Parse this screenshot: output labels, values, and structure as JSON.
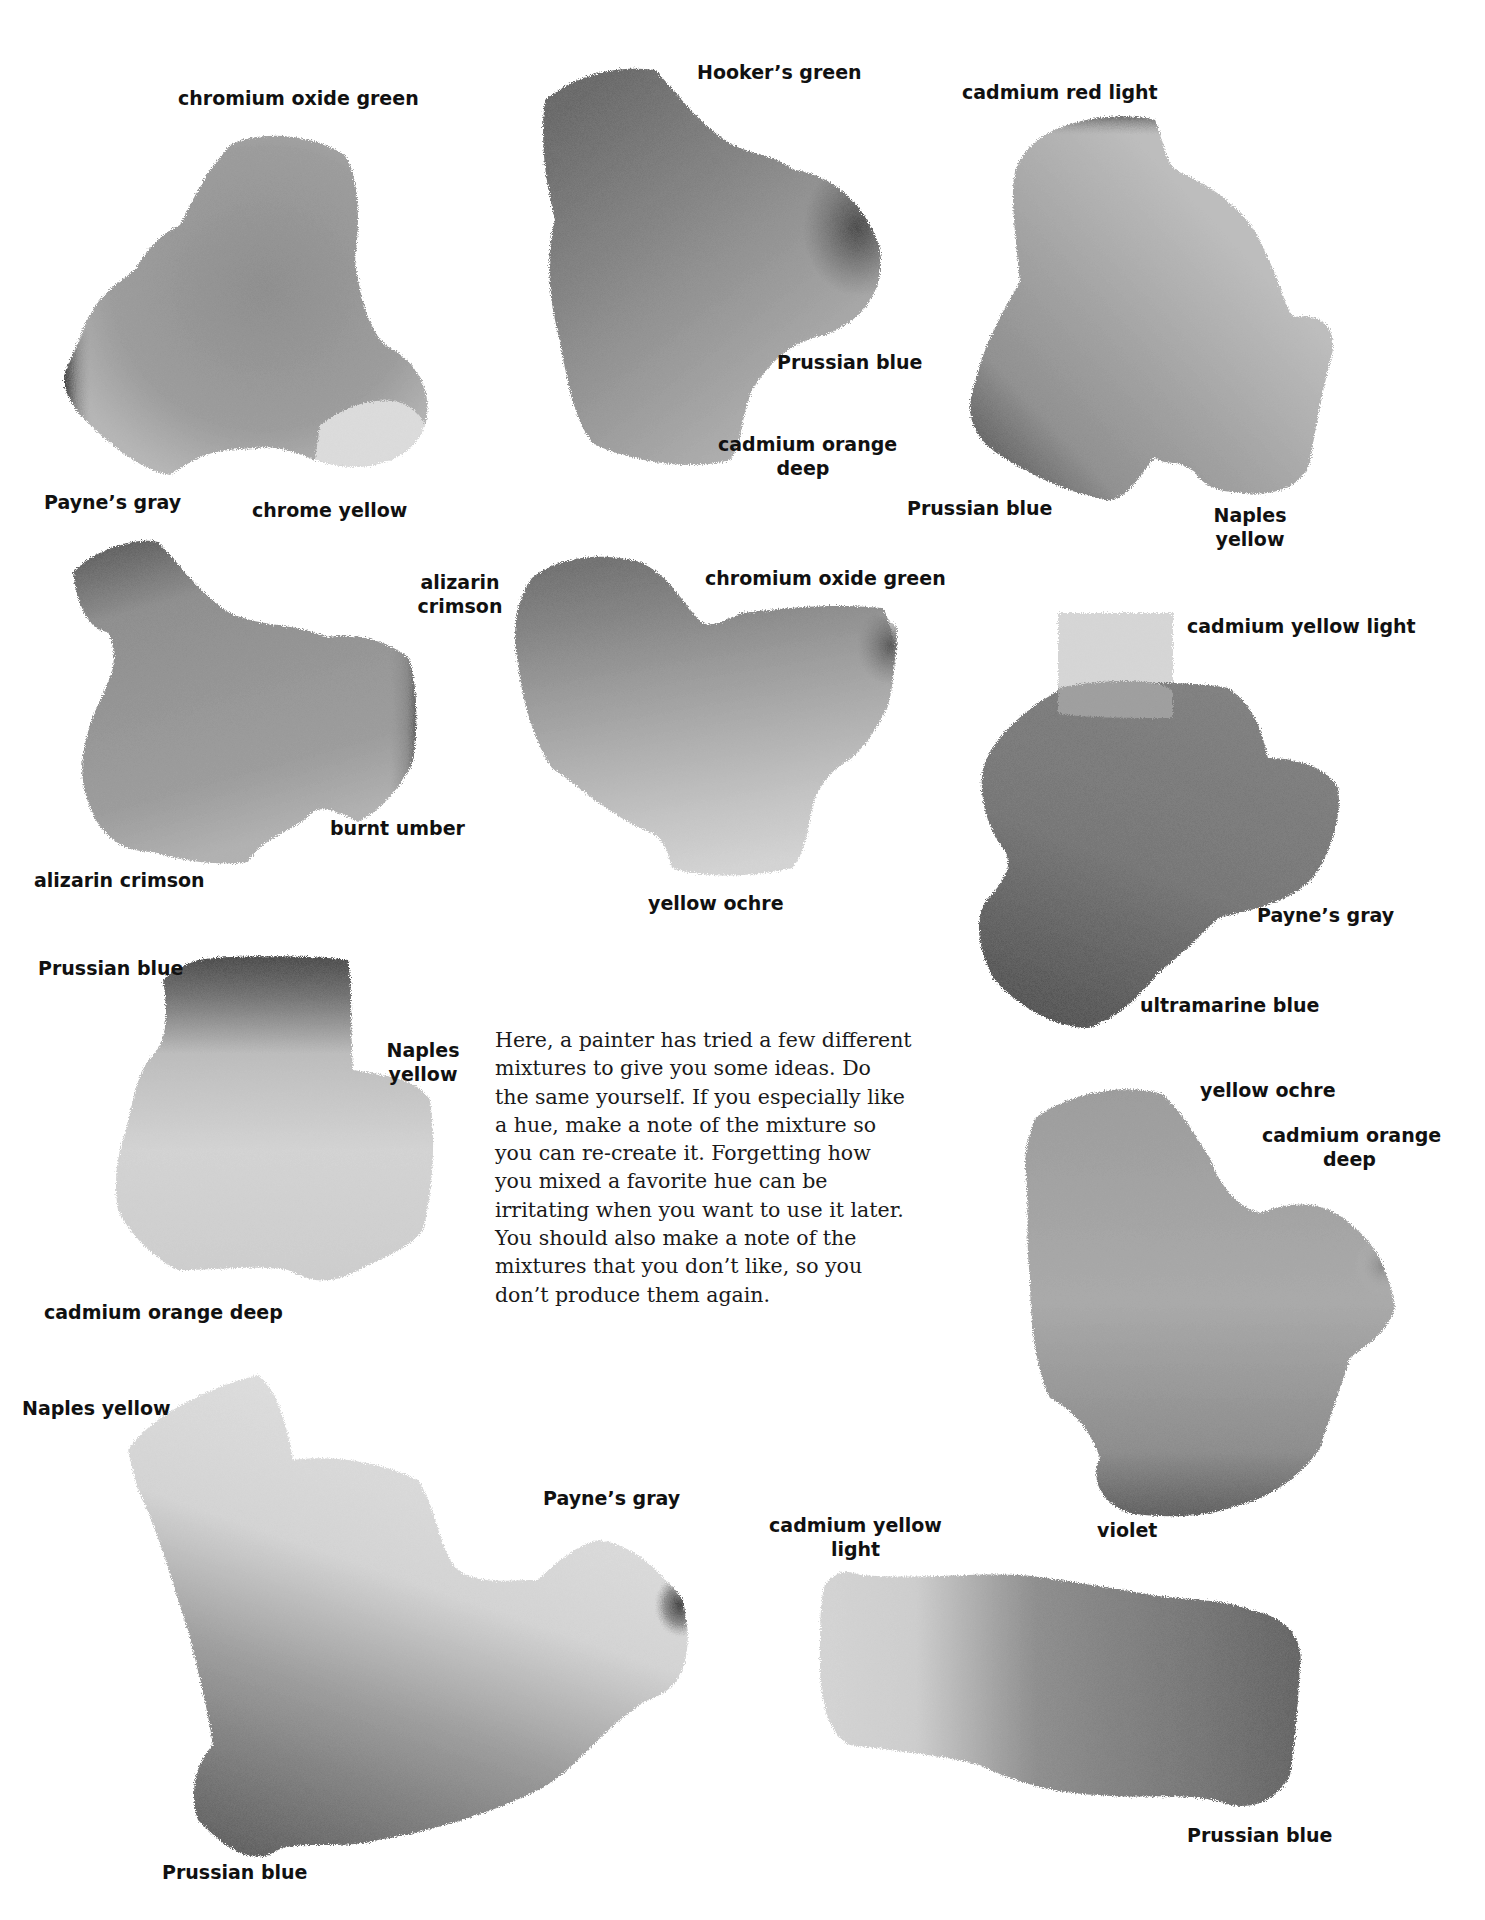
{
  "page": {
    "type": "watercolor color-mixing swatch page",
    "paper_color": "#ffffff"
  },
  "swatches": [
    {
      "id": "mix-1",
      "colors": [
        "chromium oxide green",
        "Payne's gray",
        "chrome yellow"
      ],
      "labels": [
        "chromium oxide green",
        "Payne’s gray",
        "chrome yellow"
      ]
    },
    {
      "id": "mix-2",
      "colors": [
        "Hooker's green",
        "Prussian blue",
        "cadmium orange deep"
      ],
      "labels": [
        "Hooker’s green",
        "Prussian blue",
        "cadmium orange",
        "deep"
      ]
    },
    {
      "id": "mix-3",
      "colors": [
        "cadmium red light",
        "Prussian blue",
        "Naples yellow"
      ],
      "labels": [
        "cadmium red light",
        "Prussian blue",
        "Naples",
        "yellow"
      ]
    },
    {
      "id": "mix-4",
      "colors": [
        "alizarin crimson",
        "burnt umber",
        "alizarin crimson"
      ],
      "labels": [
        "alizarin",
        "crimson",
        "burnt umber",
        "alizarin crimson"
      ]
    },
    {
      "id": "mix-5",
      "colors": [
        "chromium oxide green",
        "yellow ochre"
      ],
      "labels": [
        "chromium oxide green",
        "yellow ochre"
      ]
    },
    {
      "id": "mix-6",
      "colors": [
        "cadmium yellow light",
        "Payne's gray",
        "ultramarine blue"
      ],
      "labels": [
        "cadmium yellow light",
        "Payne’s gray",
        "ultramarine blue"
      ]
    },
    {
      "id": "mix-7",
      "colors": [
        "Prussian blue",
        "Naples yellow",
        "cadmium orange deep"
      ],
      "labels": [
        "Prussian blue",
        "Naples",
        "yellow",
        "cadmium orange deep"
      ]
    },
    {
      "id": "mix-8",
      "colors": [
        "yellow ochre",
        "cadmium orange deep",
        "violet"
      ],
      "labels": [
        "yellow ochre",
        "cadmium orange",
        "deep",
        "violet"
      ]
    },
    {
      "id": "mix-9",
      "colors": [
        "Naples yellow",
        "Payne's gray",
        "Prussian blue"
      ],
      "labels": [
        "Naples yellow",
        "Payne’s gray",
        "Prussian blue"
      ]
    },
    {
      "id": "mix-10",
      "colors": [
        "cadmium yellow light",
        "Prussian blue"
      ],
      "labels": [
        "cadmium yellow",
        "light",
        "Prussian blue"
      ]
    }
  ],
  "body_text": {
    "full": "Here, a painter has tried a few different mixtures to give you some ideas. Do the same yourself. If you especially like a hue, make a note of the mixture so you can re-create it. Forgetting how you mixed a favorite hue can be irritating when you want to use it later. You should also make a note of the mixtures that you don’t like, so you don’t produce them again.",
    "lines": [
      "Here, a painter has tried a few different",
      "mixtures to give you some ideas. Do",
      "the same yourself. If you especially like",
      "a hue, make a note of the mixture so",
      "you can re-create it. Forgetting how",
      "you mixed a favorite hue can be",
      "irritating when you want to use it later.",
      "You should also make a note of the",
      "mixtures that you don’t like, so you",
      "don’t produce them again."
    ]
  }
}
